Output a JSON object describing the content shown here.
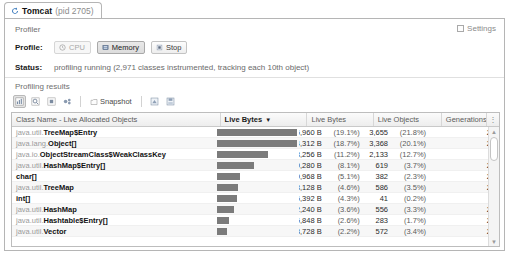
{
  "tab": {
    "icon": "refresh-spinner-icon",
    "title": "Tomcat",
    "pid": "(pid 2705)"
  },
  "profiler": {
    "label": "Profiler",
    "settings_label": "Settings",
    "settings_checked": false,
    "profile_label": "Profile:",
    "buttons": [
      {
        "label": "CPU",
        "icon": "cpu-clock-icon",
        "state": "disabled"
      },
      {
        "label": "Memory",
        "icon": "memory-chip-icon",
        "state": "active"
      },
      {
        "label": "Stop",
        "icon": "stop-square-icon",
        "state": "normal"
      }
    ],
    "status_label": "Status:",
    "status_text": "profiling running (2,971 classes instrumented, tracking each 10th object)"
  },
  "results": {
    "label": "Profiling results",
    "toolbar": [
      {
        "name": "live-results-icon",
        "pressed": true
      },
      {
        "name": "reset-results-icon",
        "pressed": false
      },
      {
        "name": "stop-collecting-icon",
        "pressed": false
      },
      {
        "name": "gc-run-icon",
        "pressed": false
      }
    ],
    "snapshot_label": "Snapshot",
    "snapshot_icon": "snapshot-icon",
    "toolbar_right": [
      {
        "name": "export-data-icon"
      },
      {
        "name": "save-data-icon"
      }
    ]
  },
  "table": {
    "columns": [
      {
        "label": "Class Name - Live Allocated Objects",
        "sorted": false
      },
      {
        "label": "Live Bytes",
        "sorted": true,
        "sort_arrow": "▼"
      },
      {
        "label": "Live Bytes",
        "sorted": false
      },
      {
        "label": "Live Objects",
        "sorted": false
      },
      {
        "label": "Generations",
        "sorted": false
      }
    ],
    "grip_icon": "column-chooser-icon",
    "rows": [
      {
        "pkg": "java.util.",
        "cls": "TreeMap$Entry",
        "bar_pct": 100.0,
        "bytes": "116,960 B",
        "bytes_pct": "(19.1%)",
        "objects": "3,655",
        "objects_pct": "(21.8%)",
        "generations": "21"
      },
      {
        "pkg": "java.lang.",
        "cls": "Object[]",
        "bar_pct": 97.7,
        "bytes": "114,312 B",
        "bytes_pct": "(18.7%)",
        "objects": "3,368",
        "objects_pct": "(20.1%)",
        "generations": "26"
      },
      {
        "pkg": "java.io.",
        "cls": "ObjectStreamClass$WeakClassKey",
        "bar_pct": 58.4,
        "bytes": "68,256 B",
        "bytes_pct": "(11.2%)",
        "objects": "2,133",
        "objects_pct": "(12.7%)",
        "generations": "3"
      },
      {
        "pkg": "java.util.",
        "cls": "HashMap$Entry[]",
        "bar_pct": 42.1,
        "bytes": "49,280 B",
        "bytes_pct": "(8.1%)",
        "objects": "619",
        "objects_pct": "(3.7%)",
        "generations": "25"
      },
      {
        "pkg": "",
        "cls": "char[]",
        "bar_pct": 26.5,
        "bytes": "30,968 B",
        "bytes_pct": "(5.1%)",
        "objects": "382",
        "objects_pct": "(2.3%)",
        "generations": "24"
      },
      {
        "pkg": "java.util.",
        "cls": "TreeMap",
        "bar_pct": 24.0,
        "bytes": "28,128 B",
        "bytes_pct": "(4.6%)",
        "objects": "586",
        "objects_pct": "(3.5%)",
        "generations": "21"
      },
      {
        "pkg": "",
        "cls": "int[]",
        "bar_pct": 22.6,
        "bytes": "26,392 B",
        "bytes_pct": "(4.3%)",
        "objects": "41",
        "objects_pct": "(0.2%)",
        "generations": "3"
      },
      {
        "pkg": "java.util.",
        "cls": "HashMap",
        "bar_pct": 19.0,
        "bytes": "22,240 B",
        "bytes_pct": "(3.6%)",
        "objects": "556",
        "objects_pct": "(3.3%)",
        "generations": "25"
      },
      {
        "pkg": "java.util.",
        "cls": "Hashtable$Entry[]",
        "bar_pct": 13.5,
        "bytes": "15,848 B",
        "bytes_pct": "(2.6%)",
        "objects": "283",
        "objects_pct": "(1.7%)",
        "generations": "25"
      },
      {
        "pkg": "java.util.",
        "cls": "Vector",
        "bar_pct": 11.7,
        "bytes": "13,728 B",
        "bytes_pct": "(2.2%)",
        "objects": "572",
        "objects_pct": "(3.4%)",
        "generations": "25"
      }
    ]
  },
  "colors": {
    "bar": "#7b7b7b",
    "frame": "#b5b5b5",
    "alt_row": "#f7f7f7"
  }
}
